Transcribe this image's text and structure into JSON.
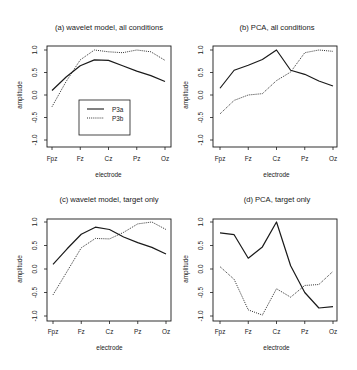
{
  "figure": {
    "xlabel": "electrode",
    "ylabel": "amplitude",
    "x_tick_labels": [
      "Fpz",
      "Fz",
      "Cz",
      "Pz",
      "Oz"
    ],
    "y_tick_labels": [
      "-1.0",
      "-0.5",
      "0.0",
      "0.5",
      "1.0"
    ],
    "legend": {
      "items": [
        {
          "label": "P3a",
          "style": "solid"
        },
        {
          "label": "P3b",
          "style": "dotted"
        }
      ]
    },
    "colors": {
      "line": "#1a1a1a",
      "axis": "#1a1a1a",
      "background": "#ffffff"
    }
  },
  "chart_data": [
    {
      "type": "line",
      "title": "(a) wavelet model, all conditions",
      "xlabel": "electrode",
      "ylabel": "amplitude",
      "ylim": [
        -1.0,
        1.0
      ],
      "grid": false,
      "legend_position": "lower center inside",
      "x": [
        "Fpz",
        "",
        "Fz",
        "",
        "Cz",
        "",
        "Pz",
        "",
        "Oz"
      ],
      "categories": [
        "Fpz",
        "Fz",
        "Cz",
        "Pz",
        "Oz"
      ],
      "series": [
        {
          "name": "P3a",
          "style": "solid",
          "values": [
            0.1,
            0.4,
            0.65,
            0.78,
            0.77,
            0.65,
            0.53,
            0.43,
            0.3
          ]
        },
        {
          "name": "P3b",
          "style": "dotted",
          "values": [
            -0.26,
            0.3,
            0.78,
            1.0,
            0.96,
            0.94,
            1.0,
            0.96,
            0.77
          ]
        }
      ]
    },
    {
      "type": "line",
      "title": "(b) PCA, all conditions",
      "xlabel": "electrode",
      "ylabel": "amplitude",
      "ylim": [
        -1.0,
        1.0
      ],
      "grid": false,
      "x": [
        "Fpz",
        "",
        "Fz",
        "",
        "Cz",
        "",
        "Pz",
        "",
        "Oz"
      ],
      "categories": [
        "Fpz",
        "Fz",
        "Cz",
        "Pz",
        "Oz"
      ],
      "series": [
        {
          "name": "P3a",
          "style": "solid",
          "values": [
            0.15,
            0.55,
            0.66,
            0.79,
            1.0,
            0.55,
            0.46,
            0.31,
            0.2
          ]
        },
        {
          "name": "P3b",
          "style": "dotted",
          "values": [
            -0.42,
            -0.12,
            0.0,
            0.03,
            0.32,
            0.51,
            0.94,
            1.0,
            0.97
          ]
        }
      ]
    },
    {
      "type": "line",
      "title": "(c) wavelet model, target only",
      "xlabel": "electrode",
      "ylabel": "amplitude",
      "ylim": [
        -1.0,
        1.0
      ],
      "grid": false,
      "x": [
        "Fpz",
        "",
        "Fz",
        "",
        "Cz",
        "",
        "Pz",
        "",
        "Oz"
      ],
      "categories": [
        "Fpz",
        "Fz",
        "Cz",
        "Pz",
        "Oz"
      ],
      "series": [
        {
          "name": "P3a",
          "style": "solid",
          "values": [
            0.1,
            0.43,
            0.74,
            0.89,
            0.84,
            0.68,
            0.56,
            0.46,
            0.32
          ]
        },
        {
          "name": "P3b",
          "style": "dotted",
          "values": [
            -0.55,
            -0.05,
            0.45,
            0.65,
            0.64,
            0.78,
            0.96,
            1.0,
            0.84
          ]
        }
      ]
    },
    {
      "type": "line",
      "title": "(d) PCA, target only",
      "xlabel": "electrode",
      "ylabel": "amplitude",
      "ylim": [
        -1.0,
        1.0
      ],
      "grid": false,
      "x": [
        "Fpz",
        "",
        "Fz",
        "",
        "Cz",
        "",
        "Pz",
        "",
        "Oz"
      ],
      "categories": [
        "Fpz",
        "Fz",
        "Cz",
        "Pz",
        "Oz"
      ],
      "series": [
        {
          "name": "P3a",
          "style": "solid",
          "values": [
            0.77,
            0.73,
            0.23,
            0.47,
            1.0,
            0.07,
            -0.5,
            -0.83,
            -0.8
          ]
        },
        {
          "name": "P3b",
          "style": "dotted",
          "values": [
            0.05,
            -0.22,
            -0.87,
            -0.98,
            -0.42,
            -0.6,
            -0.35,
            -0.33,
            -0.05
          ]
        }
      ]
    }
  ]
}
